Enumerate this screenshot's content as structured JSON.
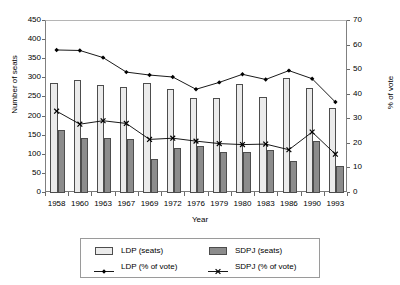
{
  "chart_data": {
    "type": "bar",
    "title": "",
    "xlabel": "Year",
    "ylabel": "Number of seats",
    "y2label": "% of vote",
    "categories": [
      "1958",
      "1960",
      "1963",
      "1967",
      "1969",
      "1972",
      "1976",
      "1979",
      "1980",
      "1983",
      "1986",
      "1990",
      "1993"
    ],
    "ylim": [
      0,
      450
    ],
    "yticks": [
      0,
      50,
      100,
      150,
      200,
      250,
      300,
      350,
      400,
      450
    ],
    "y2lim": [
      0,
      70
    ],
    "y2ticks": [
      0,
      10,
      20,
      30,
      40,
      50,
      60,
      70
    ],
    "grid": false,
    "legend_position": "bottom",
    "series": [
      {
        "name": "LDP (seats)",
        "kind": "bar",
        "axis": "left",
        "color": "#ebebeb",
        "values": [
          287,
          296,
          283,
          277,
          288,
          271,
          249,
          248,
          284,
          250,
          300,
          275,
          223
        ]
      },
      {
        "name": "SDPJ (seats)",
        "kind": "bar",
        "axis": "left",
        "color": "#8c8c8c",
        "values": [
          166,
          145,
          144,
          140,
          90,
          118,
          123,
          107,
          107,
          112,
          85,
          136,
          70
        ]
      },
      {
        "name": "LDP (% of vote)",
        "kind": "line",
        "axis": "right",
        "color": "#000000",
        "marker": "diamond",
        "values": [
          57.8,
          57.6,
          54.7,
          48.8,
          47.6,
          46.8,
          41.8,
          44.6,
          47.9,
          45.8,
          49.4,
          46.1,
          36.6
        ]
      },
      {
        "name": "SDPJ (% of vote)",
        "kind": "line",
        "axis": "right",
        "color": "#000000",
        "marker": "cross",
        "values": [
          32.9,
          27.6,
          29.0,
          27.9,
          21.4,
          21.9,
          20.7,
          19.7,
          19.3,
          19.5,
          17.2,
          24.4,
          15.4
        ]
      }
    ]
  },
  "legend": {
    "items": [
      {
        "label": "LDP (seats)",
        "type": "swatch"
      },
      {
        "label": "SDPJ (seats)",
        "type": "swatch"
      },
      {
        "label": "LDP (% of vote)",
        "type": "line"
      },
      {
        "label": "SDPJ (% of vote)",
        "type": "line"
      }
    ]
  }
}
